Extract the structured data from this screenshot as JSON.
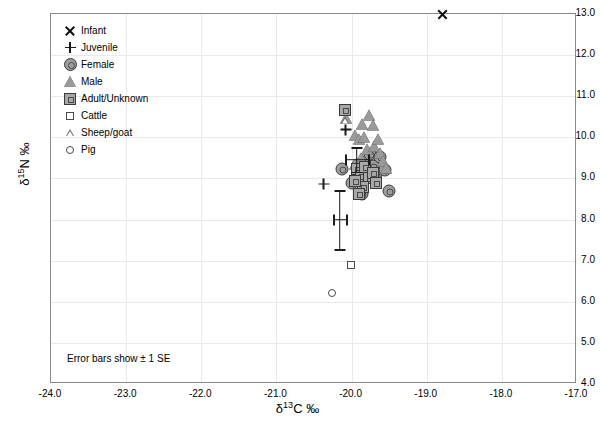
{
  "chart_data": {
    "type": "scatter",
    "title": "",
    "xlabel": "δ13C ‰",
    "ylabel": "δ15N ‰",
    "xlim": [
      -24.0,
      -17.0
    ],
    "ylim": [
      4.0,
      13.0
    ],
    "xticks": [
      "-24.0",
      "-23.0",
      "-22.0",
      "-21.0",
      "-20.0",
      "-19.0",
      "-18.0",
      "-17.0"
    ],
    "yticks": [
      "13.0",
      "12.0",
      "11.0",
      "10.0",
      "9.0",
      "8.0",
      "7.0",
      "6.0",
      "5.0",
      "4.0"
    ],
    "grid": true,
    "legend_position": "top-left-inside",
    "annotation": "Error bars show ± 1 SE",
    "legend": [
      {
        "label": "Infant",
        "symbol": "x-cross-filled"
      },
      {
        "label": "Juvenile",
        "symbol": "plus"
      },
      {
        "label": "Female",
        "symbol": "circle-filled-grey"
      },
      {
        "label": "Male",
        "symbol": "triangle-filled-grey"
      },
      {
        "label": "Adult/Unknown",
        "symbol": "square-filled-grey"
      },
      {
        "label": "Cattle",
        "symbol": "square-open-small"
      },
      {
        "label": "Sheep/goat",
        "symbol": "triangle-open-small"
      },
      {
        "label": "Pig",
        "symbol": "circle-open-small"
      }
    ],
    "series": [
      {
        "name": "Infant",
        "symbol": "x-cross-filled",
        "points": [
          [
            -18.79,
            13.0
          ]
        ]
      },
      {
        "name": "Juvenile",
        "symbol": "plus",
        "points": [
          [
            -20.08,
            10.19
          ],
          [
            -20.37,
            8.86
          ]
        ]
      },
      {
        "name": "Female",
        "symbol": "circle-filled-grey",
        "points": [
          [
            -20.13,
            9.24
          ],
          [
            -20.0,
            8.88
          ],
          [
            -19.92,
            9.33
          ],
          [
            -19.85,
            9.12
          ],
          [
            -19.8,
            9.43
          ],
          [
            -19.76,
            9.6
          ],
          [
            -19.72,
            9.3
          ],
          [
            -19.67,
            9.08
          ],
          [
            -19.62,
            9.52
          ],
          [
            -19.56,
            9.2
          ],
          [
            -19.5,
            8.7
          ],
          [
            -19.86,
            8.63
          ]
        ]
      },
      {
        "name": "Male",
        "symbol": "triangle-filled-grey",
        "points": [
          [
            -20.07,
            10.48
          ],
          [
            -19.86,
            10.33
          ],
          [
            -19.95,
            10.05
          ],
          [
            -19.9,
            9.97
          ],
          [
            -19.83,
            10.02
          ],
          [
            -19.77,
            10.55
          ],
          [
            -19.72,
            10.3
          ],
          [
            -19.79,
            9.72
          ],
          [
            -19.7,
            9.8
          ],
          [
            -19.65,
            9.95
          ],
          [
            -19.62,
            9.62
          ],
          [
            -19.58,
            9.42
          ],
          [
            -19.54,
            9.25
          ],
          [
            -19.88,
            9.5
          ],
          [
            -19.95,
            9.35
          ],
          [
            -19.74,
            9.18
          ]
        ]
      },
      {
        "name": "Adult/Unknown",
        "symbol": "square-filled-grey",
        "points": [
          [
            -20.09,
            10.66
          ],
          [
            -19.93,
            9.22
          ],
          [
            -19.88,
            9.05
          ],
          [
            -19.82,
            9.28
          ],
          [
            -19.77,
            9.0
          ],
          [
            -19.72,
            9.14
          ],
          [
            -19.85,
            8.8
          ],
          [
            -19.95,
            8.95
          ],
          [
            -19.67,
            8.9
          ],
          [
            -19.9,
            8.62
          ]
        ]
      },
      {
        "name": "Cattle",
        "symbol": "square-open-small",
        "points": [
          [
            -20.01,
            6.9
          ]
        ]
      },
      {
        "name": "Sheep/goat",
        "symbol": "triangle-open-small",
        "points": [
          [
            -20.09,
            10.42
          ]
        ]
      },
      {
        "name": "Pig",
        "symbol": "circle-open-small",
        "points": [
          [
            -20.26,
            6.21
          ]
        ]
      }
    ],
    "error_bars": [
      {
        "x": -20.16,
        "y": 8.0,
        "xerr": 0.085,
        "yerr": 0.72
      },
      {
        "x": -19.93,
        "y": 9.46,
        "xerr": 0.155,
        "yerr": 0.3
      }
    ]
  }
}
